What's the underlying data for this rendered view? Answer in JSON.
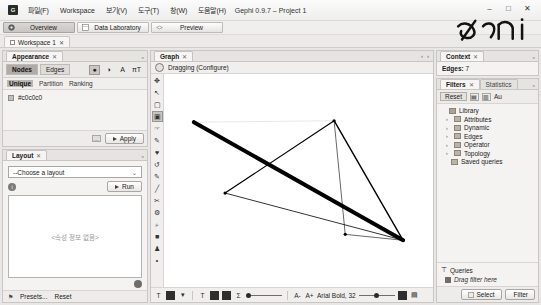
{
  "window": {
    "title": "Gephi 0.9.7 – Project 1",
    "app_icon": "G",
    "minimize": "–",
    "maximize": "□",
    "close": "✕"
  },
  "menubar": {
    "items": [
      {
        "label": "파일(F)",
        "name": "menu-file"
      },
      {
        "label": "Workspace",
        "name": "menu-workspace"
      },
      {
        "label": "보기(V)",
        "name": "menu-view"
      },
      {
        "label": "도구(T)",
        "name": "menu-tools"
      },
      {
        "label": "창(W)",
        "name": "menu-window"
      },
      {
        "label": "도움말(H)",
        "name": "menu-help"
      }
    ]
  },
  "modebar": {
    "buttons": [
      {
        "label": "Overview",
        "icon": "overview-icon",
        "active": true
      },
      {
        "label": "Data Laboratory",
        "icon": "table-icon",
        "active": false
      },
      {
        "label": "Preview",
        "icon": "preview-icon",
        "active": false
      }
    ]
  },
  "workspace": {
    "tab_label": "Workspace 1",
    "close_glyph": "✕"
  },
  "appearance": {
    "tab_label": "Appearance",
    "close_glyph": "✕",
    "minimize_glyph": "▫",
    "target_tabs": [
      {
        "label": "Nodes",
        "active": true
      },
      {
        "label": "Edges",
        "active": false
      }
    ],
    "attribute_icons": [
      {
        "name": "color-icon",
        "glyph": "●",
        "selected": true
      },
      {
        "name": "size-icon",
        "glyph": "◑",
        "selected": false
      },
      {
        "name": "label-color-icon",
        "glyph": "A",
        "selected": false
      },
      {
        "name": "label-size-icon",
        "glyph": "πT",
        "selected": false
      }
    ],
    "modes": [
      {
        "label": "Unique",
        "active": true
      },
      {
        "label": "Partition",
        "active": false
      },
      {
        "label": "Ranking",
        "active": false
      }
    ],
    "color_value": "#c0c0c0",
    "swatch_color": "#c0c0c0",
    "apply_label": "Apply",
    "palette_button": "…"
  },
  "layout": {
    "tab_label": "Layout",
    "close_glyph": "✕",
    "minimize_glyph": "▫",
    "combo_value": "--Choose a layout",
    "combo_chevron": "⌄",
    "info_glyph": "i",
    "run_label": "Run",
    "placeholder": "<속성 정보 없음>",
    "presets_label": "Presets...",
    "reset_label": "Reset",
    "flag_glyph": "⚑"
  },
  "graph": {
    "tab_label": "Graph",
    "close_glyph": "✕",
    "nav_prev": "‹",
    "nav_next": "›",
    "nav_menu": "⌄",
    "tool_label": "Dragging (Configure)",
    "vtools": [
      {
        "name": "drag-tool-icon",
        "glyph": "✥",
        "selected": false
      },
      {
        "name": "cursor-tool-icon",
        "glyph": "↖",
        "selected": false
      },
      {
        "name": "rectangle-select-icon",
        "glyph": "▢",
        "selected": false
      },
      {
        "name": "node-select-icon",
        "glyph": "▣",
        "selected": true
      },
      {
        "name": "hand-tool-icon",
        "glyph": "☞",
        "selected": false
      },
      {
        "name": "edge-pencil-icon",
        "glyph": "✎",
        "selected": false
      },
      {
        "name": "brush-tool-icon",
        "glyph": "♥",
        "selected": false
      },
      {
        "name": "rotate-tool-icon",
        "glyph": "↺",
        "selected": false
      },
      {
        "name": "pencil-tool-icon",
        "glyph": "✎",
        "selected": false
      },
      {
        "name": "line-tool-icon",
        "glyph": "╱",
        "selected": false
      },
      {
        "name": "scissors-tool-icon",
        "glyph": "✂",
        "selected": false
      },
      {
        "name": "settings-tool-icon",
        "glyph": "⚙",
        "selected": false
      },
      {
        "name": "magnifier-tool-icon",
        "glyph": "⌕",
        "selected": false
      },
      {
        "name": "square-tool-icon",
        "glyph": "■",
        "selected": false
      },
      {
        "name": "person-tool-icon",
        "glyph": "♟",
        "selected": false
      },
      {
        "name": "dot-tool-icon",
        "glyph": "•",
        "selected": false
      }
    ],
    "bottom_toolbar": {
      "items": [
        {
          "name": "label-toggle-icon",
          "glyph": "T"
        },
        {
          "name": "node-shape-icon",
          "glyph": "▬"
        },
        {
          "name": "dropdown-icon",
          "glyph": "▾"
        },
        {
          "name": "node-label-icon",
          "glyph": "T"
        },
        {
          "name": "edge-thumbnail-icon",
          "glyph": "▨"
        },
        {
          "name": "edge-thumbnail2-icon",
          "glyph": "▨"
        },
        {
          "name": "sigma-icon",
          "glyph": "Σ"
        },
        {
          "name": "label-size-down-icon",
          "glyph": "A-"
        },
        {
          "name": "label-size-up-icon",
          "glyph": "A+"
        },
        {
          "name": "color-box-icon",
          "glyph": ""
        },
        {
          "name": "screenshot-icon",
          "glyph": "▤"
        }
      ],
      "font_label": "Arial Bold, 32",
      "slider1_value": 22,
      "slider2_value": 55
    },
    "chart_data": {
      "type": "scatter",
      "title": "Graph visualization",
      "nodes": [
        {
          "id": "n1",
          "x": 236,
          "y": 142
        },
        {
          "id": "n2",
          "x": 299,
          "y": 141
        },
        {
          "id": "n3",
          "x": 250,
          "y": 190
        },
        {
          "id": "n4",
          "x": 330,
          "y": 222
        },
        {
          "id": "n5",
          "x": 304,
          "y": 218
        }
      ],
      "edges": [
        {
          "source": "n1",
          "target": "n4",
          "weight": 4
        },
        {
          "source": "n2",
          "target": "n3",
          "weight": 1.2
        },
        {
          "source": "n2",
          "target": "n4",
          "weight": 1.4
        },
        {
          "source": "n2",
          "target": "n5",
          "weight": 0.6
        },
        {
          "source": "n4",
          "target": "n5",
          "weight": 0.6
        },
        {
          "source": "n1",
          "target": "n2",
          "weight": 0.1
        },
        {
          "source": "n3",
          "target": "n4",
          "weight": 0.8
        }
      ],
      "node_color": "#000000",
      "edge_color": "#000000"
    }
  },
  "context": {
    "tab_label": "Context",
    "close_glyph": "✕",
    "minimize_glyph": "▫",
    "edges_label": "Edges:",
    "edges_count": "7"
  },
  "filters": {
    "tabs": [
      {
        "label": "Filters",
        "active": true,
        "close_glyph": "✕"
      },
      {
        "label": "Statistics",
        "active": false
      }
    ],
    "minimize_glyph": "▫",
    "reset_label": "Reset",
    "toolbar_icons": [
      {
        "name": "filter-import-icon",
        "glyph": "▤"
      },
      {
        "name": "filter-export-icon",
        "glyph": "▥"
      }
    ],
    "autoapply_label": "Au",
    "library_label": "Library",
    "tree_items": [
      {
        "label": "Attributes",
        "expandable": true
      },
      {
        "label": "Dynamic",
        "expandable": true
      },
      {
        "label": "Edges",
        "expandable": true
      },
      {
        "label": "Operator",
        "expandable": true
      },
      {
        "label": "Topology",
        "expandable": true
      },
      {
        "label": "Saved queries",
        "expandable": false
      }
    ],
    "queries_label": "Queries",
    "drop_hint": "Drag filter here",
    "select_label": "Select",
    "filter_label": "Filter",
    "arrow_glyph": "›"
  }
}
